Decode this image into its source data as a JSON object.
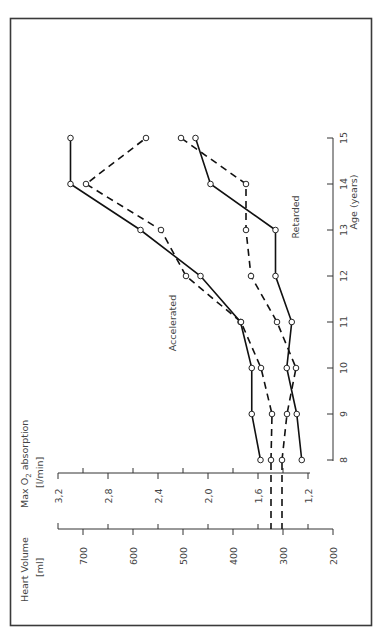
{
  "chart_data": {
    "type": "line",
    "orientation": "rotated-90-ccw",
    "title": "",
    "xlabel": "Age (years)",
    "x": [
      8,
      9,
      10,
      11,
      12,
      13,
      14,
      15
    ],
    "y_axes": [
      {
        "id": "heart_volume",
        "label": "Heart Volume",
        "unit": "[ml]",
        "ticks": [
          "200",
          "300",
          "400",
          "500",
          "600",
          "700"
        ],
        "range": [
          200,
          700
        ]
      },
      {
        "id": "max_o2",
        "label": "Max O2 absorption",
        "label_parts": [
          "Max O",
          "2",
          " absorption"
        ],
        "unit": "[l/min]",
        "ticks": [
          "1,2",
          "1,6",
          "2,0",
          "2,4",
          "2,8",
          "3,2"
        ],
        "range": [
          1.2,
          3.2
        ]
      }
    ],
    "series": [
      {
        "name": "Accelerated – Max O2 absorption",
        "group": "Accelerated",
        "axis": "max_o2",
        "style": "solid",
        "values": [
          1.58,
          1.65,
          1.65,
          1.74,
          2.06,
          2.54,
          3.1,
          3.1
        ]
      },
      {
        "name": "Accelerated – Heart Volume",
        "group": "Accelerated",
        "axis": "heart_volume",
        "style": "dashed",
        "values": [
          324,
          322,
          344,
          384,
          494,
          544,
          694,
          574
        ]
      },
      {
        "name": "Retarded – Max O2 absorption",
        "group": "Retarded",
        "axis": "max_o2",
        "style": "solid",
        "values": [
          1.25,
          1.29,
          1.37,
          1.33,
          1.46,
          1.46,
          1.98,
          2.1
        ]
      },
      {
        "name": "Retarded – Heart Volume",
        "group": "Retarded",
        "axis": "heart_volume",
        "style": "dashed",
        "values": [
          302,
          292,
          274,
          312,
          364,
          374,
          374,
          504
        ]
      }
    ],
    "annotations": [
      "Accelerated",
      "Retarded"
    ],
    "legend": "none",
    "grid": false
  },
  "labels": {
    "heart_volume_title": "Heart Volume",
    "heart_volume_unit": "[ml]",
    "o2_title_a": "Max O",
    "o2_title_sub": "2",
    "o2_title_b": " absorption",
    "o2_unit": "[l/min]",
    "age_title": "Age (years)",
    "accelerated": "Accelerated",
    "retarded": "Retarded"
  }
}
